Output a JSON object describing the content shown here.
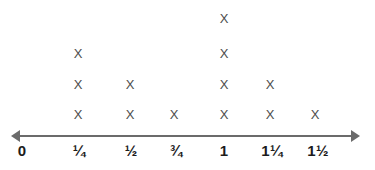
{
  "chart_data": {
    "type": "scatter",
    "plot_style": "dot-plot-number-line",
    "title": "",
    "subtitle": "",
    "xlabel": "",
    "ylabel": "",
    "categories": [
      "0",
      "¼",
      "½",
      "¾",
      "1",
      "1¼",
      "1½"
    ],
    "values": [
      0,
      3,
      2,
      1,
      4,
      2,
      1
    ],
    "x": [
      0,
      0.25,
      0.5,
      0.75,
      1,
      1.25,
      1.5
    ],
    "xlim": [
      0,
      1.5
    ],
    "grid": false,
    "legend": null,
    "marker": "X",
    "annotations": [],
    "axis": {
      "arrow_left": true,
      "arrow_right": true,
      "tick_marks_visible": false
    },
    "points": [
      {
        "label": "0",
        "value": 0.0,
        "count": 0
      },
      {
        "label": "¼",
        "value": 0.25,
        "count": 3
      },
      {
        "label": "½",
        "value": 0.5,
        "count": 2
      },
      {
        "label": "¾",
        "value": 0.75,
        "count": 1
      },
      {
        "label": "1",
        "value": 1.0,
        "count": 4
      },
      {
        "label": "1¼",
        "value": 1.25,
        "count": 2
      },
      {
        "label": "1½",
        "value": 1.5,
        "count": 1
      }
    ],
    "total_marks": 13
  },
  "colors": {
    "axis": "#6b6b6b",
    "mark": "#4c4c4c",
    "label": "#1c1c1c",
    "background": "#ffffff"
  },
  "geometry": {
    "column_centers_px": [
      22,
      79,
      131,
      176,
      224,
      272,
      318
    ],
    "mark_column_centers_px": [
      22,
      78,
      130,
      174,
      224,
      270,
      315
    ],
    "row_centers_px": [
      114,
      84,
      53,
      18
    ],
    "axis_y_px": 135
  }
}
